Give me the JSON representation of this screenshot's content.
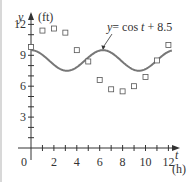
{
  "chart_data": {
    "type": "scatter",
    "title": "",
    "xlabel": "t (h)",
    "ylabel": "y (ft)",
    "x_axis": {
      "name": "t",
      "unit": "(h)",
      "ticks": [
        0,
        2,
        4,
        6,
        8,
        10,
        12
      ],
      "range": [
        0,
        13
      ]
    },
    "y_axis": {
      "name": "y",
      "unit": "(ft)",
      "ticks": [
        3,
        6,
        9,
        12
      ],
      "range": [
        0,
        12.5
      ]
    },
    "origin_label": "0",
    "series": [
      {
        "name": "data",
        "kind": "scatter",
        "marker": "square-open",
        "x": [
          0,
          1,
          2,
          3,
          4,
          5,
          6,
          7,
          8,
          9,
          10,
          11,
          12
        ],
        "y": [
          9.8,
          11.4,
          11.6,
          11.2,
          9.5,
          8.4,
          6.6,
          5.7,
          5.5,
          6.0,
          6.9,
          8.5,
          10.0
        ]
      },
      {
        "name": "y = cos t + 8.5",
        "kind": "line",
        "formula": "cos(t) + 8.5",
        "t_range": [
          0,
          12.3
        ],
        "color": "#777777"
      }
    ],
    "annotations": [
      {
        "text": "y = cos t + 8.5",
        "points_to": {
          "t": 6.28,
          "y": 9.5
        }
      }
    ],
    "grid": false,
    "legend": "none"
  },
  "labels": {
    "y_var": "y",
    "y_unit": "(ft)",
    "x_var": "t",
    "x_unit": "(h)",
    "origin": "0",
    "eq_y": "y",
    "eq_rest": "=  cos ",
    "eq_t": "t",
    "eq_tail": " + 8.5"
  },
  "colors": {
    "axis": "#333333",
    "curve": "#7a7a7a",
    "marker": "#555555"
  }
}
